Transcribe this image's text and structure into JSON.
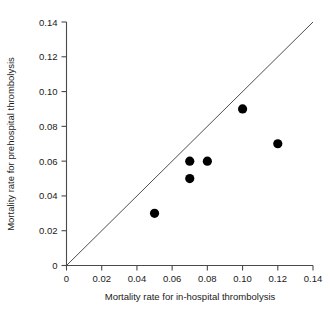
{
  "chart_data": {
    "type": "scatter",
    "title": "",
    "xlabel": "Mortality rate for in-hospital thrombolysis",
    "ylabel": "Mortality rate for prehospital thrombolysis",
    "xlim": [
      0,
      0.14
    ],
    "ylim": [
      0,
      0.14
    ],
    "xticks": [
      0,
      0.02,
      0.04,
      0.06,
      0.08,
      0.1,
      0.12,
      0.14
    ],
    "yticks": [
      0,
      0.02,
      0.04,
      0.06,
      0.08,
      0.1,
      0.12,
      0.14
    ],
    "xticklabels": [
      "0",
      "0.02",
      "0.04",
      "0.06",
      "0.08",
      "0.10",
      "0.12",
      "0.14"
    ],
    "yticklabels": [
      "0",
      "0.02",
      "0.04",
      "0.06",
      "0.08",
      "0.10",
      "0.12",
      "0.14"
    ],
    "grid": false,
    "legend": null,
    "series": [
      {
        "name": "Trials",
        "marker": "filled-circle",
        "color": "#000000",
        "points": [
          {
            "x": 0.05,
            "y": 0.03
          },
          {
            "x": 0.07,
            "y": 0.06
          },
          {
            "x": 0.07,
            "y": 0.05
          },
          {
            "x": 0.08,
            "y": 0.06
          },
          {
            "x": 0.1,
            "y": 0.09
          },
          {
            "x": 0.12,
            "y": 0.07
          }
        ]
      }
    ],
    "annotations": [
      {
        "type": "line-of-equality",
        "from": {
          "x": 0,
          "y": 0
        },
        "to": {
          "x": 0.14,
          "y": 0.14
        },
        "color": "#3a3a3a"
      }
    ]
  },
  "axes": {
    "x_tick_labels": [
      "0",
      "0.02",
      "0.04",
      "0.06",
      "0.08",
      "0.10",
      "0.12",
      "0.14"
    ],
    "y_tick_labels": [
      "0",
      "0.02",
      "0.04",
      "0.06",
      "0.08",
      "0.10",
      "0.12",
      "0.14"
    ],
    "x_title": "Mortality rate for in-hospital thrombolysis",
    "y_title": "Mortality rate for prehospital thrombolysis"
  }
}
